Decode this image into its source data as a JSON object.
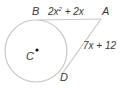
{
  "diagram": {
    "type": "circle with two tangent segments from external point",
    "points": {
      "A": "A",
      "B": "B",
      "C": "C",
      "D": "D"
    },
    "segments": {
      "AB": {
        "label_base": "2x",
        "label_exp": "2",
        "label_rest": " + 2x"
      },
      "AD": {
        "label": "7x + 12"
      }
    },
    "colors": {
      "circle": "#c8c8c8",
      "lines": "#c8c8c8",
      "text": "#3a3a3a",
      "center_dot": "#111111"
    }
  }
}
